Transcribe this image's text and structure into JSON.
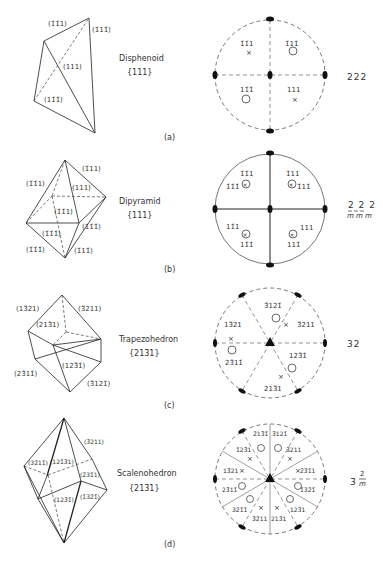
{
  "figure": {
    "panels": [
      {
        "id": "a",
        "caption": "(a)",
        "form_name": "Disphenoid",
        "form_index": "{111}",
        "symmetry": "222",
        "crystal_face_labels": [
          "(1̄1̄1)",
          "(1̄11̄)",
          "(111)",
          "(11̄1̄)"
        ],
        "stereogram_labels": [
          "1̄1̄1",
          "1̄11̄",
          "11̄1̄",
          "111"
        ],
        "stereogram_symbols": [
          "x",
          "o",
          "o",
          "x"
        ]
      },
      {
        "id": "b",
        "caption": "(b)",
        "form_name": "Dipyramid",
        "form_index": "{111}",
        "symmetry_top": "2 2 2",
        "symmetry_bottom": "m m m",
        "crystal_face_labels": [
          "(1̄1̄1)",
          "(1̄11)",
          "(111)",
          "(1̄1̄1)",
          "(11̄1̄)",
          "(1̄1̄1̄)",
          "(1̄11̄)",
          "(1̄1̄1̄)"
        ],
        "stereogram_labels": {
          "q1_top": "1̄11",
          "q1_bottom": "1̄11̄",
          "q2_top": "1̄1̄1",
          "q2_bottom": "1̄1̄1̄",
          "q3_top": "11̄1",
          "q3_bottom": "11̄1̄",
          "q4_top": "111",
          "q4_bottom": "111̄"
        }
      },
      {
        "id": "c",
        "caption": "(c)",
        "form_name": "Trapezohedron",
        "form_index": "{213̄1}",
        "symmetry": "32",
        "crystal_face_labels": [
          "(13̄21)",
          "(3̄211)",
          "(213̄1)",
          "(23̄11̄)",
          "(123̄1̄)",
          "(3̄121̄)"
        ],
        "stereogram_labels": [
          "3̄121̄",
          "13̄21",
          "3̄211",
          "23̄11̄",
          "123̄1̄",
          "213̄1"
        ]
      },
      {
        "id": "d",
        "caption": "(d)",
        "form_name": "Scalenohedron",
        "form_index": "{213̄1}",
        "symmetry_main": "3̄",
        "symmetry_frac_top": "2",
        "symmetry_frac_bottom": "m",
        "crystal_face_labels": [
          "(3̄211)",
          "(32̄11̄)",
          "(121̄3̄1)",
          "(2̄31̄1)",
          "(123̄1̄)",
          "(1̄32̄1̄)"
        ],
        "stereogram_labels": [
          "2̄13̄1̄",
          "3̄121̄",
          "1̄23̄1",
          "3̄211",
          "13̄21",
          "2̄3̄1̄1",
          "23̄11̄",
          "1̄32̄1̄",
          "32̄1̄1̄",
          "123̄1",
          "3̄2̄11",
          "213̄1"
        ]
      }
    ]
  }
}
